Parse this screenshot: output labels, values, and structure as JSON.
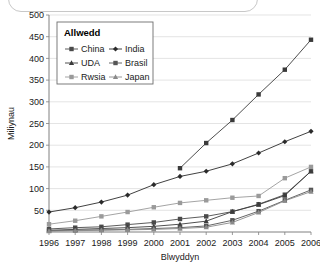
{
  "frame": {
    "decorative_rounded_box": true
  },
  "chart_data": {
    "type": "line",
    "title": "",
    "xlabel": "Blwyddyn",
    "ylabel": "Miliynau",
    "categories": [
      "1996",
      "1997",
      "1998",
      "1999",
      "2000",
      "2001",
      "2002",
      "2003",
      "2004",
      "2005",
      "2006"
    ],
    "ylim": [
      0,
      500
    ],
    "ytick_step": 50,
    "yticks": [
      "50",
      "100",
      "150",
      "200",
      "250",
      "300",
      "350",
      "400",
      "450",
      "500"
    ],
    "grid": true,
    "legend": {
      "title": "Allwedd",
      "position": "upper-left-inside",
      "entries": [
        "China",
        "India",
        "UDA",
        "Brasil",
        "Rwsia",
        "Japan"
      ]
    },
    "series": [
      {
        "name": "China",
        "color": "#4a4a4a",
        "marker": "square",
        "values": [
          7,
          10,
          12,
          17,
          22,
          30,
          36,
          47,
          64,
          86,
          140
        ]
      },
      {
        "name": "India",
        "color": "#2b2b2b",
        "marker": "diamond",
        "values": [
          46,
          56,
          69,
          85,
          109,
          128,
          140,
          157,
          182,
          208,
          232
        ]
      },
      {
        "name": "UDA",
        "color": "#3c3c3c",
        "marker": "triangle",
        "values": [
          4,
          6,
          8,
          10,
          13,
          18,
          25,
          47,
          63,
          84,
          140
        ]
      },
      {
        "name": "Brasil",
        "color": "#555555",
        "marker": "square",
        "values": [
          3,
          4,
          5,
          6,
          8,
          10,
          14,
          27,
          48,
          73,
          97
        ]
      },
      {
        "name": "Rwsia",
        "color": "#9a9a9a",
        "marker": "square",
        "values": [
          18,
          26,
          36,
          46,
          57,
          67,
          73,
          79,
          83,
          124,
          150
        ]
      },
      {
        "name": "Japan",
        "color": "#8a8a8a",
        "marker": "triangle",
        "values": [
          2,
          3,
          4,
          5,
          6,
          8,
          11,
          22,
          45,
          72,
          93
        ]
      }
    ],
    "china_overlay": {
      "name": "China-high",
      "values": [
        null,
        null,
        null,
        null,
        null,
        147,
        205,
        258,
        317,
        374,
        443
      ]
    }
  }
}
